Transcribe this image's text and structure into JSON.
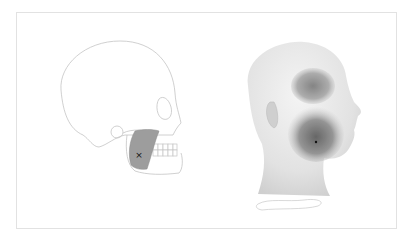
{
  "figure": {
    "description": "Masseter trigger point and referred pain pattern",
    "left_panel": {
      "label": "skull-lateral-view",
      "marker": "×"
    },
    "right_panel": {
      "label": "head-lateral-view-referral-pattern"
    },
    "colors": {
      "outline": "#bdbdbd",
      "muscle_fill": "#9a9a9a",
      "referral_dark": "#6e6e6e",
      "skin": "#e6e6e6",
      "frame": "#e2e2e2"
    }
  }
}
